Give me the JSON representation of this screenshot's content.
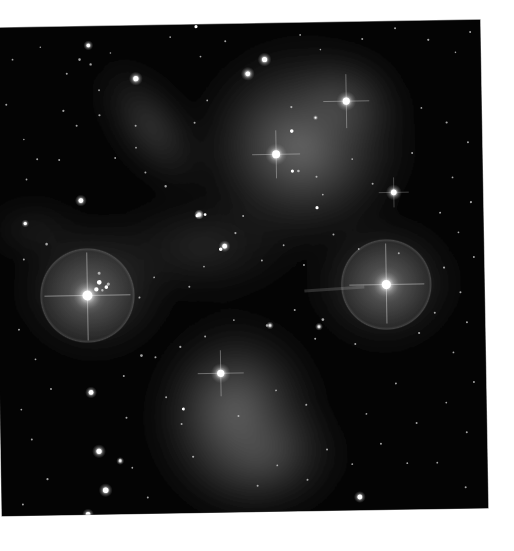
{
  "image": {
    "subject": "Pleiades star cluster (M45) with reflection nebulae",
    "rendering": "grayscale astrophotograph on white background, slightly rotated",
    "frame": {
      "x": 0,
      "y": 28,
      "width": 480,
      "height": 490,
      "rotation_deg": -0.95
    },
    "colors": {
      "background": "#ffffff",
      "sky": "#030303",
      "nebula": "#9a9a9a",
      "star": "#ffffff"
    },
    "bright_stars": [
      {
        "name": "left-star",
        "x": 83,
        "y": 297,
        "r": 6,
        "halo": 48
      },
      {
        "name": "right-star",
        "x": 382,
        "y": 291,
        "r": 5.5,
        "halo": 46
      },
      {
        "name": "upper-center-star",
        "x": 274,
        "y": 159,
        "r": 5,
        "halo": 0
      },
      {
        "name": "upper-right-star",
        "x": 345,
        "y": 107,
        "r": 4.5,
        "halo": 0
      },
      {
        "name": "lower-center-star",
        "x": 215,
        "y": 377,
        "r": 4.5,
        "halo": 0
      },
      {
        "name": "right-mid-star",
        "x": 391,
        "y": 199,
        "r": 3.5,
        "halo": 0
      },
      {
        "name": "top-left-star-a",
        "x": 264,
        "y": 64,
        "r": 3.2,
        "halo": 0
      },
      {
        "name": "top-left-star-b",
        "x": 247,
        "y": 78,
        "r": 3,
        "halo": 0
      },
      {
        "name": "far-left-star",
        "x": 135,
        "y": 81,
        "r": 3.2,
        "halo": 0
      },
      {
        "name": "left-upper-star",
        "x": 78,
        "y": 202,
        "r": 3,
        "halo": 0
      },
      {
        "name": "center-pair-star",
        "x": 221,
        "y": 250,
        "r": 3,
        "halo": 0
      },
      {
        "name": "bottom-left-star-a",
        "x": 85,
        "y": 394,
        "r": 3,
        "halo": 0
      },
      {
        "name": "bottom-left-star-b",
        "x": 92,
        "y": 453,
        "r": 3.2,
        "halo": 0
      },
      {
        "name": "bottom-left-star-c",
        "x": 98,
        "y": 492,
        "r": 3.4,
        "halo": 0
      },
      {
        "name": "bottom-left-star-d",
        "x": 80,
        "y": 516,
        "r": 3,
        "halo": 0
      },
      {
        "name": "bottom-right-star",
        "x": 352,
        "y": 503,
        "r": 3,
        "halo": 0
      }
    ]
  }
}
